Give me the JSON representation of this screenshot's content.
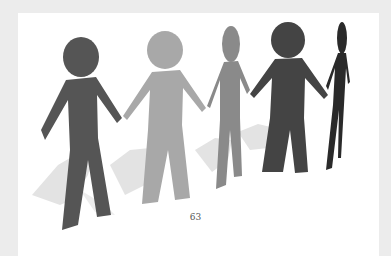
{
  "page": {
    "number": "63",
    "background_color": "#ececec",
    "paper_color": "#ffffff"
  },
  "illustration": {
    "subject": "paper-chain-people-holding-hands",
    "figures": [
      {
        "name": "figure-1",
        "color": "#555555"
      },
      {
        "name": "figure-2",
        "color": "#a8a8a8"
      },
      {
        "name": "figure-3",
        "color": "#8a8a8a"
      },
      {
        "name": "figure-4",
        "color": "#444444"
      },
      {
        "name": "figure-5",
        "color": "#2a2a2a"
      }
    ],
    "shadow_color": "#e2e2e2"
  }
}
